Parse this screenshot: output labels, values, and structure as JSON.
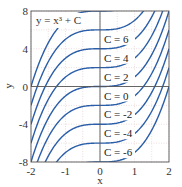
{
  "chart_data": {
    "type": "line",
    "title": "",
    "annotation": "y = x³ + C",
    "xlabel": "x",
    "ylabel": "y",
    "xlim": [
      -2,
      2
    ],
    "ylim": [
      -8,
      8
    ],
    "xticks": [
      -2,
      -1,
      0,
      1,
      2
    ],
    "yticks": [
      -8,
      -4,
      0,
      4,
      8
    ],
    "xtick_labels": [
      "-2",
      "-1",
      "0",
      "1",
      "2"
    ],
    "ytick_labels": [
      "-8",
      "-4",
      "0",
      "4",
      "8"
    ],
    "grid": true,
    "function": "y = x^3 + C",
    "series": [
      {
        "name": "C = 6",
        "C": 6
      },
      {
        "name": "C = 4",
        "C": 4
      },
      {
        "name": "C = 2",
        "C": 2
      },
      {
        "name": "C = 0",
        "C": 0
      },
      {
        "name": "C = -2",
        "C": -2
      },
      {
        "name": "C = -4",
        "C": -4
      },
      {
        "name": "C = -6",
        "C": -6
      },
      {
        "name": "",
        "C": -8
      },
      {
        "name": "",
        "C": 8
      }
    ],
    "colors": {
      "curve": "#2a5ea8",
      "axis": "#555555",
      "grid": "#e3c7c7"
    }
  }
}
